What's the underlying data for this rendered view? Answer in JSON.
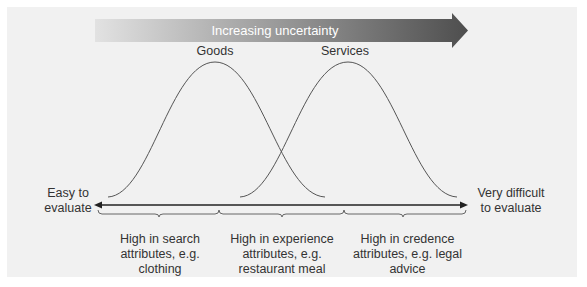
{
  "arrow": {
    "label": "Increasing uncertainty",
    "gradient_start": "#e0e0e0",
    "gradient_end": "#505050"
  },
  "curves": {
    "goods_label": "Goods",
    "services_label": "Services",
    "line_color": "#555555"
  },
  "axis": {
    "left_label_line1": "Easy to",
    "left_label_line2": "evaluate",
    "right_label_line1": "Very difficult",
    "right_label_line2": "to evaluate"
  },
  "categories": [
    {
      "line1": "High in search",
      "line2": "attributes, e.g.",
      "line3": "clothing"
    },
    {
      "line1": "High in experience",
      "line2": "attributes, e.g.",
      "line3": "restaurant meal"
    },
    {
      "line1": "High in credence",
      "line2": "attributes, e.g. legal",
      "line3": "advice"
    }
  ]
}
